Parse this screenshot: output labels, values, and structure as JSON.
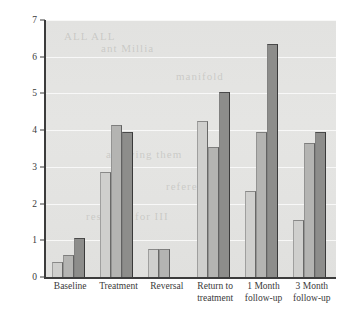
{
  "chart_data": {
    "type": "bar",
    "title": "",
    "xlabel": "",
    "ylabel": "Average days per week exercised",
    "ylim": [
      0,
      7
    ],
    "yticks": [
      0,
      1,
      2,
      3,
      4,
      5,
      6,
      7
    ],
    "ytick_labels": [
      "0",
      "1",
      "2",
      "3",
      "4",
      "5",
      "6",
      "7"
    ],
    "grid": true,
    "legend": "none",
    "categories": [
      "Baseline",
      "Treatment",
      "Reversal",
      "Return to treatment",
      "1 Month follow-up",
      "3 Month follow-up"
    ],
    "category_lines": [
      [
        "Baseline"
      ],
      [
        "Treatment"
      ],
      [
        "Reversal"
      ],
      [
        "Return to",
        "treatment"
      ],
      [
        "1 Month",
        "follow-up"
      ],
      [
        "3 Month",
        "follow-up"
      ]
    ],
    "series": [
      {
        "name": "Participant 1",
        "color": "#cfcfcd",
        "values": [
          0.4,
          2.85,
          0.75,
          4.25,
          2.35,
          1.55
        ]
      },
      {
        "name": "Participant 2",
        "color": "#b4b4b2",
        "values": [
          0.6,
          4.15,
          0.75,
          3.55,
          3.95,
          3.65
        ]
      },
      {
        "name": "Participant 3",
        "color": "#8d8d8b",
        "values": [
          1.05,
          3.95,
          0,
          5.05,
          6.35,
          3.95
        ]
      }
    ]
  },
  "ghost_text": [
    {
      "text": "ALL ALL",
      "x": 18,
      "y": 10
    },
    {
      "text": "ant Millia",
      "x": 55,
      "y": 22
    },
    {
      "text": "manifold",
      "x": 130,
      "y": 50
    },
    {
      "text": "allowing them",
      "x": 60,
      "y": 128
    },
    {
      "text": "reference",
      "x": 120,
      "y": 160
    },
    {
      "text": "reserved for III",
      "x": 40,
      "y": 190
    }
  ]
}
